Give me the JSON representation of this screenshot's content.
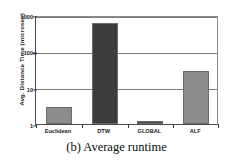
{
  "chart_data": {
    "type": "bar",
    "title": "",
    "caption": "(b) Average runtime",
    "xlabel": "",
    "ylabel": "Avg. Distance Time (microsec)",
    "yscale": "log",
    "ylim": [
      1,
      1000
    ],
    "yticks": [
      1,
      10,
      100,
      1000
    ],
    "ytick_labels": [
      "1",
      "10",
      "100",
      "1000"
    ],
    "grid": true,
    "legend": "none",
    "categories": [
      "Euclidean",
      "DTW",
      "GLOBAL",
      "ALF"
    ],
    "values": [
      3,
      600,
      1.2,
      29
    ],
    "bar_colors": [
      "#8c8c8c",
      "#3c3c3c",
      "#4a4a4a",
      "#8c8c8c"
    ],
    "series": [
      {
        "name": "Avg. Distance Time",
        "values": [
          3,
          600,
          1.2,
          29
        ]
      }
    ]
  },
  "axis": {
    "y_title": "Avg. Distance Time (microsec)",
    "tick_1000": "1000",
    "tick_100": "100",
    "tick_10": "10",
    "tick_1": "1"
  },
  "categories": {
    "c0": "Euclidean",
    "c1": "DTW",
    "c2": "GLOBAL",
    "c3": "ALF"
  },
  "caption": {
    "text": "(b) Average runtime"
  },
  "colors": {
    "bar_light": "#8c8c8c",
    "bar_dark": "#3c3c3c",
    "axis": "#4a4a4a",
    "grid": "#7d7d7d",
    "text": "#1a1a1a"
  }
}
